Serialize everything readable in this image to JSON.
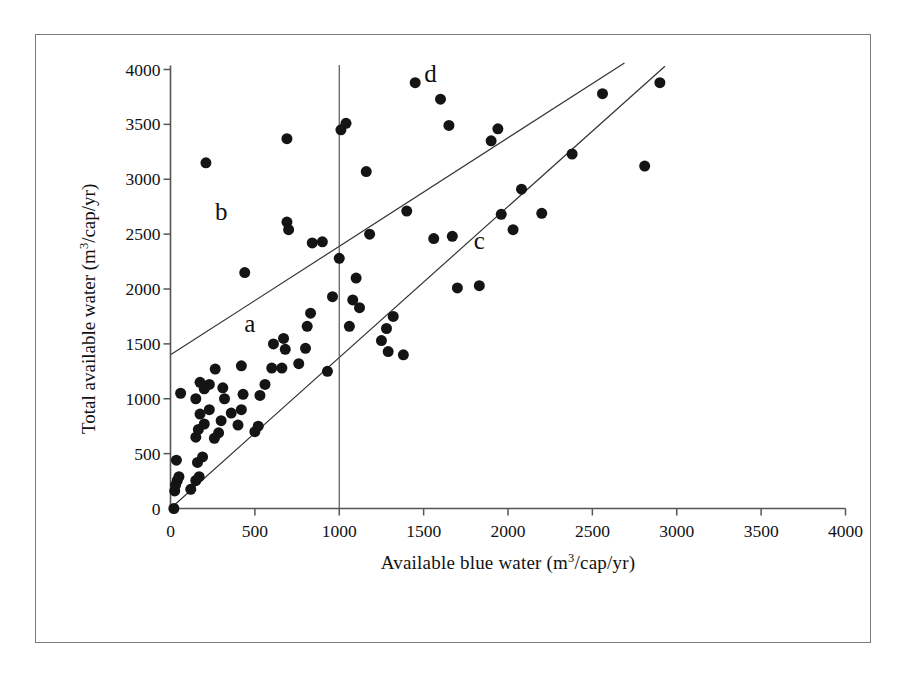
{
  "chart_data": {
    "type": "scatter",
    "title": "",
    "xlabel": "Available blue water (m3/cap/yr)",
    "ylabel": "Total available water (m3/cap/yr)",
    "xlabel_parts": {
      "pre": "Available blue water (m",
      "sup": "3",
      "post": "/cap/yr)"
    },
    "ylabel_parts": {
      "pre": "Total available water (m",
      "sup": "3",
      "post": "/cap/yr)"
    },
    "xlim": [
      0,
      4000
    ],
    "ylim": [
      0,
      4000
    ],
    "xticks": [
      0,
      500,
      1000,
      1500,
      2000,
      2500,
      3000,
      3500,
      4000
    ],
    "yticks": [
      0,
      500,
      1000,
      1500,
      2000,
      2500,
      3000,
      3500,
      4000
    ],
    "xtick_labels": [
      "0",
      "500",
      "1000",
      "1500",
      "2000",
      "2500",
      "3000",
      "3500",
      "4000"
    ],
    "ytick_labels": [
      "0",
      "500",
      "1000",
      "1500",
      "2000",
      "2500",
      "3000",
      "3500",
      "4000"
    ],
    "grid": false,
    "legend": null,
    "marker": {
      "shape": "circle",
      "color": "#141414",
      "size": 11
    },
    "annotations": [
      {
        "text": "a",
        "x": 470,
        "y": 1680
      },
      {
        "text": "b",
        "x": 300,
        "y": 2700
      },
      {
        "text": "c",
        "x": 1830,
        "y": 2440
      },
      {
        "text": "d",
        "x": 1540,
        "y": 3960
      }
    ],
    "reference_lines": [
      {
        "name": "upper-boundary-line",
        "type": "segment",
        "x0": 0,
        "y0": 1400,
        "x1": 2690,
        "y1": 4060,
        "color": "#333333"
      },
      {
        "name": "lower-boundary-line",
        "type": "segment",
        "x0": 0,
        "y0": 0,
        "x1": 2930,
        "y1": 4030,
        "color": "#333333"
      },
      {
        "name": "vertical-threshold-line",
        "type": "vertical",
        "x": 1000,
        "y0": 0,
        "y1": 4040,
        "color": "#555555"
      }
    ],
    "points": [
      {
        "x": 20,
        "y": 0
      },
      {
        "x": 25,
        "y": 160
      },
      {
        "x": 30,
        "y": 215
      },
      {
        "x": 40,
        "y": 255
      },
      {
        "x": 50,
        "y": 290
      },
      {
        "x": 35,
        "y": 440
      },
      {
        "x": 60,
        "y": 1050
      },
      {
        "x": 120,
        "y": 175
      },
      {
        "x": 150,
        "y": 255
      },
      {
        "x": 170,
        "y": 290
      },
      {
        "x": 160,
        "y": 420
      },
      {
        "x": 190,
        "y": 470
      },
      {
        "x": 150,
        "y": 650
      },
      {
        "x": 165,
        "y": 720
      },
      {
        "x": 200,
        "y": 770
      },
      {
        "x": 175,
        "y": 860
      },
      {
        "x": 230,
        "y": 900
      },
      {
        "x": 150,
        "y": 1000
      },
      {
        "x": 200,
        "y": 1090
      },
      {
        "x": 175,
        "y": 1150
      },
      {
        "x": 230,
        "y": 1130
      },
      {
        "x": 210,
        "y": 3150
      },
      {
        "x": 260,
        "y": 640
      },
      {
        "x": 285,
        "y": 690
      },
      {
        "x": 300,
        "y": 800
      },
      {
        "x": 320,
        "y": 1000
      },
      {
        "x": 310,
        "y": 1100
      },
      {
        "x": 265,
        "y": 1270
      },
      {
        "x": 360,
        "y": 870
      },
      {
        "x": 400,
        "y": 760
      },
      {
        "x": 420,
        "y": 900
      },
      {
        "x": 430,
        "y": 1040
      },
      {
        "x": 420,
        "y": 1300
      },
      {
        "x": 440,
        "y": 2150
      },
      {
        "x": 500,
        "y": 700
      },
      {
        "x": 520,
        "y": 750
      },
      {
        "x": 530,
        "y": 1030
      },
      {
        "x": 560,
        "y": 1130
      },
      {
        "x": 600,
        "y": 1280
      },
      {
        "x": 610,
        "y": 1500
      },
      {
        "x": 660,
        "y": 1280
      },
      {
        "x": 680,
        "y": 1450
      },
      {
        "x": 670,
        "y": 1550
      },
      {
        "x": 690,
        "y": 2610
      },
      {
        "x": 700,
        "y": 2540
      },
      {
        "x": 690,
        "y": 3370
      },
      {
        "x": 760,
        "y": 1320
      },
      {
        "x": 800,
        "y": 1460
      },
      {
        "x": 810,
        "y": 1660
      },
      {
        "x": 830,
        "y": 1780
      },
      {
        "x": 840,
        "y": 2420
      },
      {
        "x": 900,
        "y": 2430
      },
      {
        "x": 930,
        "y": 1250
      },
      {
        "x": 960,
        "y": 1930
      },
      {
        "x": 1000,
        "y": 2280
      },
      {
        "x": 1010,
        "y": 3450
      },
      {
        "x": 1040,
        "y": 3510
      },
      {
        "x": 1060,
        "y": 1660
      },
      {
        "x": 1080,
        "y": 1900
      },
      {
        "x": 1100,
        "y": 2100
      },
      {
        "x": 1120,
        "y": 1830
      },
      {
        "x": 1160,
        "y": 3070
      },
      {
        "x": 1180,
        "y": 2500
      },
      {
        "x": 1250,
        "y": 1530
      },
      {
        "x": 1280,
        "y": 1640
      },
      {
        "x": 1290,
        "y": 1430
      },
      {
        "x": 1320,
        "y": 1750
      },
      {
        "x": 1380,
        "y": 1400
      },
      {
        "x": 1400,
        "y": 2710
      },
      {
        "x": 1450,
        "y": 3880
      },
      {
        "x": 1560,
        "y": 2460
      },
      {
        "x": 1600,
        "y": 3730
      },
      {
        "x": 1650,
        "y": 3490
      },
      {
        "x": 1670,
        "y": 2480
      },
      {
        "x": 1700,
        "y": 2010
      },
      {
        "x": 1830,
        "y": 2030
      },
      {
        "x": 1900,
        "y": 3350
      },
      {
        "x": 1940,
        "y": 3460
      },
      {
        "x": 1960,
        "y": 2680
      },
      {
        "x": 2030,
        "y": 2540
      },
      {
        "x": 2080,
        "y": 2910
      },
      {
        "x": 2200,
        "y": 2690
      },
      {
        "x": 2380,
        "y": 3230
      },
      {
        "x": 2560,
        "y": 3780
      },
      {
        "x": 2810,
        "y": 3120
      },
      {
        "x": 2900,
        "y": 3880
      }
    ]
  },
  "figure": {
    "border_color": "#7a7a7a",
    "axis_color": "#555555",
    "point_color": "#141414"
  }
}
